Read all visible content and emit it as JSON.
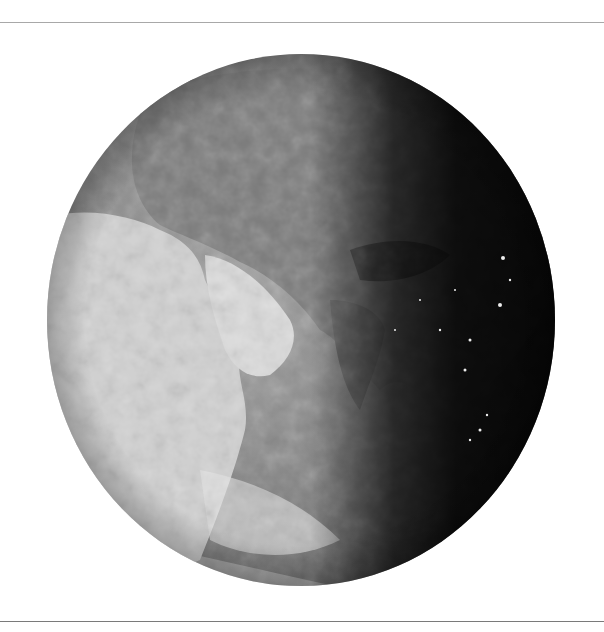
{
  "image": {
    "subject": "Earth globe (grayscale) centered on Africa, Middle East and Asia with day/night terminator",
    "style": "grayscale",
    "colors": {
      "background": "#ffffff",
      "rule_top": "#a8a8a8",
      "rule_bottom": "#7a7a7a",
      "ocean_day": "#8c8c8c",
      "land_day": "#d8d8d8",
      "night": "#141414",
      "city_lights": "#f0f0f0"
    },
    "globe": {
      "cx": 301,
      "cy": 320,
      "rx": 254,
      "ry": 266
    }
  }
}
